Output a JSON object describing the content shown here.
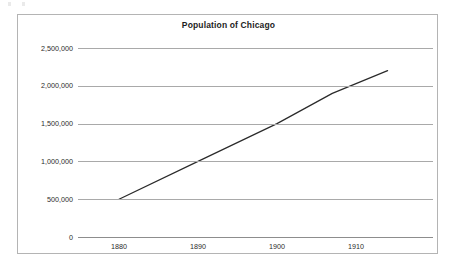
{
  "figure": {
    "background_color": "#ffffff",
    "border_color": "#b4b4b4",
    "title": "Population of Chicago"
  },
  "chart_data": {
    "type": "line",
    "title": "Population of Chicago",
    "xlabel": "",
    "ylabel": "",
    "grid": true,
    "legend": "none",
    "line_color": "#2a2a2a",
    "grid_color": "#a9a9a9",
    "xlim": [
      1875,
      1915
    ],
    "ylim": [
      0,
      2500000
    ],
    "x": [
      1880,
      1890,
      1900,
      1910
    ],
    "xtick_labels": [
      "1880",
      "1890",
      "1900",
      "1910"
    ],
    "ytick_values": [
      0,
      500000,
      1000000,
      1500000,
      2000000,
      2500000
    ],
    "ytick_labels": [
      "0",
      "500,000",
      "1,000,000",
      "1,500,000",
      "2,000,000",
      "2,500,000"
    ],
    "series": [
      {
        "name": "Population",
        "x": [
          1880,
          1890,
          1900,
          1907,
          1914
        ],
        "values": [
          500000,
          1000000,
          1500000,
          1900000,
          2200000
        ]
      }
    ]
  },
  "axes": {
    "y_labels": [
      {
        "text": "2,500,000",
        "value": 2500000
      },
      {
        "text": "2,000,000",
        "value": 2000000
      },
      {
        "text": "1,500,000",
        "value": 1500000
      },
      {
        "text": "1,000,000",
        "value": 1000000
      },
      {
        "text": "500,000",
        "value": 500000
      },
      {
        "text": "0",
        "value": 0
      }
    ],
    "x_labels": [
      {
        "text": "1880",
        "value": 1880
      },
      {
        "text": "1890",
        "value": 1890
      },
      {
        "text": "1900",
        "value": 1900
      },
      {
        "text": "1910",
        "value": 1910
      }
    ]
  }
}
